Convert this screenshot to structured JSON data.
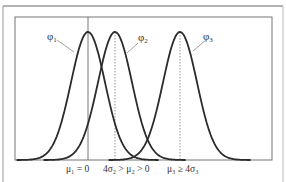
{
  "figure": {
    "curves": [
      {
        "id": "phi1",
        "label": "φ",
        "subscript": "1",
        "mean_x": 88
      },
      {
        "id": "phi2",
        "label": "φ",
        "subscript": "2",
        "mean_x": 115
      },
      {
        "id": "phi3",
        "label": "φ",
        "subscript": "3",
        "mean_x": 180
      }
    ],
    "axis_labels": {
      "mu1": "μ₁ = 0",
      "mu2": "4σ₂ > μ₂ > 0",
      "mu3": "μ₃ ≥ 4σ₃"
    },
    "colors": {
      "curve": "#2b2b2b",
      "frame": "#777777",
      "text": "#333333"
    }
  }
}
